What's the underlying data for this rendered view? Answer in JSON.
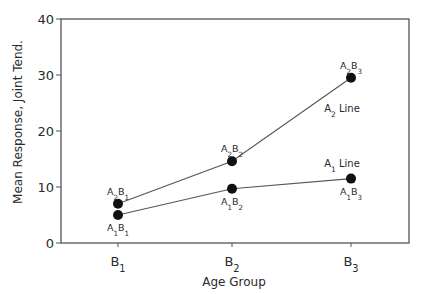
{
  "chart_data": {
    "type": "line",
    "title": "",
    "xlabel": "Age Group",
    "ylabel": "Mean Response, Joint Tend.",
    "categories": [
      "B1",
      "B2",
      "B3"
    ],
    "category_display": [
      {
        "main": "B",
        "sub": "1"
      },
      {
        "main": "B",
        "sub": "2"
      },
      {
        "main": "B",
        "sub": "3"
      }
    ],
    "ylim": [
      0,
      40
    ],
    "yticks": [
      0,
      10,
      20,
      30,
      40
    ],
    "grid": false,
    "legend": "none (inline line labels)",
    "series": [
      {
        "name": "A1 Line",
        "label_main": "A",
        "label_sub": "1",
        "label_suffix": " Line",
        "values": [
          5,
          9.7,
          11.5
        ],
        "point_labels": [
          {
            "a": "1",
            "b": "1"
          },
          {
            "a": "1",
            "b": "2"
          },
          {
            "a": "1",
            "b": "3"
          }
        ]
      },
      {
        "name": "A2 Line",
        "label_main": "A",
        "label_sub": "2",
        "label_suffix": " Line",
        "values": [
          7,
          14.6,
          29.5
        ],
        "point_labels": [
          {
            "a": "2",
            "b": "1"
          },
          {
            "a": "2",
            "b": "2"
          },
          {
            "a": "2",
            "b": "3"
          }
        ]
      }
    ],
    "colors": {
      "line": "#555555",
      "marker": "#111111",
      "axis": "#555555",
      "text": "#2a2a2a"
    }
  }
}
